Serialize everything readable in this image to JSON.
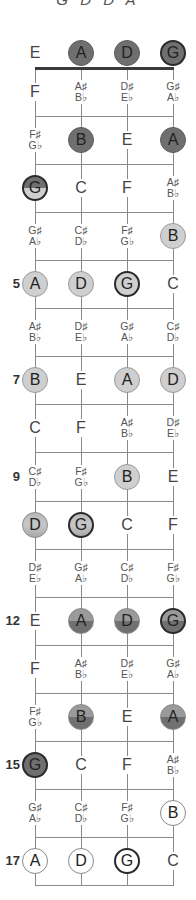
{
  "title": "G D D A",
  "tuning_strings": [
    "E",
    "A",
    "D",
    "G"
  ],
  "colors": {
    "dark": "#6f6f6f",
    "light": "#cfcfcf",
    "white": "#ffffff",
    "root_ring": "#2a2a2a"
  },
  "fret_markers": [
    {
      "fret": 5,
      "label": "5"
    },
    {
      "fret": 7,
      "label": "7"
    },
    {
      "fret": 9,
      "label": "9"
    },
    {
      "fret": 12,
      "label": "12"
    },
    {
      "fret": 15,
      "label": "15"
    },
    {
      "fret": 17,
      "label": "17"
    }
  ],
  "rows": [
    {
      "fret": 0,
      "cells": [
        {
          "n": "E"
        },
        {
          "n": "A",
          "s": "dark"
        },
        {
          "n": "D",
          "s": "dark"
        },
        {
          "n": "G",
          "s": "dark",
          "root": true
        }
      ]
    },
    {
      "fret": 1,
      "cells": [
        {
          "n": "F"
        },
        {
          "sharp": "A♯",
          "flat": "B♭"
        },
        {
          "sharp": "D♯",
          "flat": "E♭"
        },
        {
          "sharp": "G♯",
          "flat": "A♭"
        }
      ]
    },
    {
      "fret": 2,
      "cells": [
        {
          "sharp": "F♯",
          "flat": "G♭"
        },
        {
          "n": "B",
          "s": "dark"
        },
        {
          "n": "E"
        },
        {
          "n": "A",
          "s": "dark"
        }
      ]
    },
    {
      "fret": 3,
      "cells": [
        {
          "n": "G",
          "s": "split-dl",
          "root": true
        },
        {
          "n": "C"
        },
        {
          "n": "F"
        },
        {
          "sharp": "A♯",
          "flat": "B♭"
        }
      ]
    },
    {
      "fret": 4,
      "cells": [
        {
          "sharp": "G♯",
          "flat": "A♭"
        },
        {
          "sharp": "C♯",
          "flat": "D♭"
        },
        {
          "sharp": "F♯",
          "flat": "G♭"
        },
        {
          "n": "B",
          "s": "light"
        }
      ]
    },
    {
      "fret": 5,
      "cells": [
        {
          "n": "A",
          "s": "light"
        },
        {
          "n": "D",
          "s": "light"
        },
        {
          "n": "G",
          "s": "light",
          "root": true
        },
        {
          "n": "C"
        }
      ]
    },
    {
      "fret": 6,
      "cells": [
        {
          "sharp": "A♯",
          "flat": "B♭"
        },
        {
          "sharp": "D♯",
          "flat": "E♭"
        },
        {
          "sharp": "G♯",
          "flat": "A♭"
        },
        {
          "sharp": "C♯",
          "flat": "D♭"
        }
      ]
    },
    {
      "fret": 7,
      "cells": [
        {
          "n": "B",
          "s": "light"
        },
        {
          "n": "E"
        },
        {
          "n": "A",
          "s": "light"
        },
        {
          "n": "D",
          "s": "light"
        }
      ]
    },
    {
      "fret": 8,
      "cells": [
        {
          "n": "C"
        },
        {
          "n": "F"
        },
        {
          "sharp": "A♯",
          "flat": "B♭"
        },
        {
          "sharp": "D♯",
          "flat": "E♭"
        }
      ]
    },
    {
      "fret": 9,
      "cells": [
        {
          "sharp": "C♯",
          "flat": "D♭"
        },
        {
          "sharp": "F♯",
          "flat": "G♭"
        },
        {
          "n": "B",
          "s": "light"
        },
        {
          "n": "E"
        }
      ]
    },
    {
      "fret": 10,
      "cells": [
        {
          "n": "D",
          "s": "split-ld2"
        },
        {
          "n": "G",
          "s": "split-ld2",
          "root": true
        },
        {
          "n": "C"
        },
        {
          "n": "F"
        }
      ]
    },
    {
      "fret": 11,
      "cells": [
        {
          "sharp": "D♯",
          "flat": "E♭"
        },
        {
          "sharp": "G♯",
          "flat": "A♭"
        },
        {
          "sharp": "C♯",
          "flat": "D♭"
        },
        {
          "sharp": "F♯",
          "flat": "G♭"
        }
      ]
    },
    {
      "fret": 12,
      "cells": [
        {
          "n": "E"
        },
        {
          "n": "A",
          "s": "split-ld"
        },
        {
          "n": "D",
          "s": "split-ld"
        },
        {
          "n": "G",
          "s": "split-ld",
          "root": true
        }
      ]
    },
    {
      "fret": 13,
      "cells": [
        {
          "n": "F"
        },
        {
          "sharp": "A♯",
          "flat": "B♭"
        },
        {
          "sharp": "D♯",
          "flat": "E♭"
        },
        {
          "sharp": "G♯",
          "flat": "A♭"
        }
      ]
    },
    {
      "fret": 14,
      "cells": [
        {
          "sharp": "F♯",
          "flat": "G♭"
        },
        {
          "n": "B",
          "s": "split-ld"
        },
        {
          "n": "E"
        },
        {
          "n": "A",
          "s": "split-ld"
        }
      ]
    },
    {
      "fret": 15,
      "cells": [
        {
          "n": "G",
          "s": "dark",
          "root": true
        },
        {
          "n": "C"
        },
        {
          "n": "F"
        },
        {
          "sharp": "A♯",
          "flat": "B♭"
        }
      ]
    },
    {
      "fret": 16,
      "cells": [
        {
          "sharp": "G♯",
          "flat": "A♭"
        },
        {
          "sharp": "C♯",
          "flat": "D♭"
        },
        {
          "sharp": "F♯",
          "flat": "G♭"
        },
        {
          "n": "B",
          "s": "white"
        }
      ]
    },
    {
      "fret": 17,
      "cells": [
        {
          "n": "A",
          "s": "white"
        },
        {
          "n": "D",
          "s": "white"
        },
        {
          "n": "G",
          "s": "white",
          "root": true
        },
        {
          "n": "C"
        }
      ]
    }
  ]
}
